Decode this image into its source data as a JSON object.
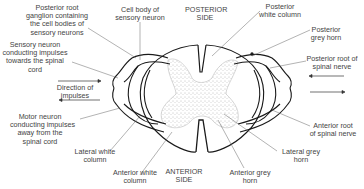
{
  "diagram": {
    "sides": {
      "posterior": [
        "POSTERIOR",
        "SIDE"
      ],
      "anterior": [
        "ANTERIOR",
        "SIDE"
      ]
    },
    "labels": {
      "posterior_root_ganglion": [
        "Posterior root",
        "ganglion containing",
        "the cell bodies of",
        "sensory neurons"
      ],
      "cell_body_sensory": [
        "Cell body of",
        "sensory neuron"
      ],
      "sensory_neuron": [
        "Sensory neuron",
        "conducting impulses",
        "towards the spinal",
        "cord"
      ],
      "direction_of_impulses": [
        "Direction of",
        "impulses"
      ],
      "motor_neuron": [
        "Motor neuron",
        "conducting impulses",
        "away from the",
        "spinal cord"
      ],
      "lateral_white_column": [
        "Lateral white",
        "column"
      ],
      "anterior_white_column": [
        "Anterior white",
        "column"
      ],
      "posterior_white_column": [
        "Posterior",
        "white column"
      ],
      "posterior_grey_horn": [
        "Posterior",
        "grey horn"
      ],
      "posterior_root_spinal_nerve": [
        "Posterior root of",
        "spinal nerve"
      ],
      "anterior_root_spinal_nerve": [
        "Anterior root",
        "of spinal nerve"
      ],
      "lateral_grey_horn": [
        "Lateral grey",
        "horn"
      ],
      "anterior_grey_horn": [
        "Anterior grey",
        "horn"
      ]
    },
    "colors": {
      "line": "#1a1a1a",
      "leader": "#555555",
      "grey_matter_dots": "#777777"
    }
  }
}
